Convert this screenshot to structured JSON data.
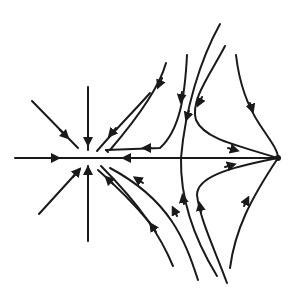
{
  "diagram": {
    "type": "phase-portrait",
    "stroke_color": "#1a1a1a",
    "background": "#ffffff",
    "nodes": [
      {
        "name": "left-node",
        "x": 88,
        "y": 158,
        "kind": "stable-star-node"
      },
      {
        "name": "right-node",
        "x": 278,
        "y": 158,
        "kind": "equilibrium-point"
      }
    ],
    "axis": {
      "x1": 15,
      "y1": 158,
      "x2": 278,
      "y2": 158
    }
  }
}
